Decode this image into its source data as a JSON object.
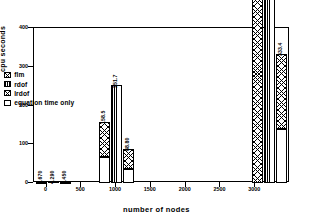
{
  "chart_data": {
    "type": "bar",
    "title": "",
    "xlabel": "number of nodes",
    "ylabel": "cpu seconds",
    "xlim": [
      -180,
      3500
    ],
    "ylim": [
      0,
      400
    ],
    "xticks": [
      "0",
      "500",
      "1000",
      "1500",
      "2000",
      "2500",
      "3000"
    ],
    "xtick_values": [
      0,
      500,
      1000,
      1500,
      2000,
      2500,
      3000
    ],
    "yticks": [
      "0",
      "100",
      "200",
      "300",
      "400"
    ],
    "ytick_values": [
      0,
      100,
      200,
      300,
      400
    ],
    "grid": false,
    "legend_position": "center-left",
    "series": [
      {
        "name": "flm",
        "pattern": "crosshatch"
      },
      {
        "name": "rdof",
        "pattern": "vlines"
      },
      {
        "name": "lrdof",
        "pattern": "crosshatch"
      },
      {
        "name": "equation time only",
        "pattern": "white"
      }
    ],
    "groups": [
      {
        "nodes": 100,
        "bars": [
          {
            "series": "flm",
            "total": 4.67,
            "label": "4.670",
            "base": 2.1
          },
          {
            "series": "rdof",
            "total": 4.29,
            "label": "4.290",
            "base": 0
          },
          {
            "series": "lrdof",
            "total": 4.45,
            "label": "4.450",
            "base": 2.0
          }
        ]
      },
      {
        "nodes": 1000,
        "bars": [
          {
            "series": "flm",
            "total": 158.5,
            "label": "158.5",
            "base": 66.0
          },
          {
            "series": "rdof",
            "total": 251.7,
            "label": "251.7",
            "base": 0
          },
          {
            "series": "lrdof",
            "total": 88.8,
            "label": "88.80",
            "base": 37.0
          }
        ]
      },
      {
        "nodes": 3200,
        "bars": [
          {
            "series": "flm",
            "total": 786.8,
            "label": "786.8",
            "base": 0
          },
          {
            "series": "rdof",
            "total": 2116,
            "label": "2116",
            "base": 0
          },
          {
            "series": "lrdof",
            "total": 333.4,
            "label": "333.4",
            "base": 140.0
          }
        ]
      }
    ]
  }
}
